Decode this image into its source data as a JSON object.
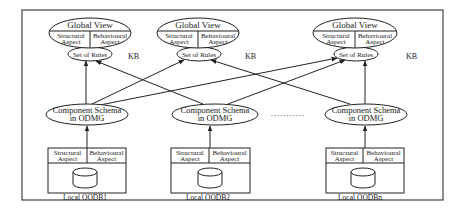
{
  "diagram": {
    "knowledge_bases": [
      {
        "global_view": "Global View",
        "structural": [
          "Structural",
          "Aspect"
        ],
        "behavioural": [
          "Behavioural",
          "Aspect"
        ],
        "rules": "Set of Rules",
        "kb_label": "KB"
      },
      {
        "global_view": "Global View",
        "structural": [
          "Structural",
          "Aspect"
        ],
        "behavioural": [
          "Behavioural",
          "Aspect"
        ],
        "rules": "Set of Rules",
        "kb_label": "KB"
      },
      {
        "global_view": "Global View",
        "structural": [
          "Structural",
          "Aspect"
        ],
        "behavioural": [
          "Behavioural",
          "Aspect"
        ],
        "rules": "Set of Rules",
        "kb_label": "KB"
      }
    ],
    "component_schemas": [
      {
        "line1": "Component Schema",
        "line2": "in ODMG"
      },
      {
        "line1": "Component Schema",
        "line2": "in ODMG"
      },
      {
        "line1": "Component Schema",
        "line2": "in ODMG"
      }
    ],
    "ellipsis": "...........",
    "local_databases": [
      {
        "structural": [
          "Structural",
          "Aspect"
        ],
        "behavioural": [
          "Behavioural",
          "Aspect"
        ],
        "label": "Local OODB1"
      },
      {
        "structural": [
          "Structural",
          "Aspect"
        ],
        "behavioural": [
          "Behavioural",
          "Aspect"
        ],
        "label": "Local OODB2"
      },
      {
        "structural": [
          "Structural",
          "Aspect"
        ],
        "behavioural": [
          "Behavioural",
          "Aspect"
        ],
        "label": "Local OODBn"
      }
    ],
    "connections": [
      {
        "from": "Local OODB1",
        "to": "Component Schema 1"
      },
      {
        "from": "Local OODB2",
        "to": "Component Schema 2"
      },
      {
        "from": "Local OODBn",
        "to": "Component Schema 3"
      },
      {
        "from": "Component Schema 1",
        "to": "Set of Rules 1"
      },
      {
        "from": "Component Schema 1",
        "to": "Set of Rules 2"
      },
      {
        "from": "Component Schema 1",
        "to": "Set of Rules 3"
      },
      {
        "from": "Component Schema 2",
        "to": "Set of Rules 1"
      },
      {
        "from": "Component Schema 2",
        "to": "Set of Rules 3"
      },
      {
        "from": "Component Schema 3",
        "to": "Set of Rules 2"
      },
      {
        "from": "Component Schema 3",
        "to": "Set of Rules 3"
      }
    ]
  }
}
